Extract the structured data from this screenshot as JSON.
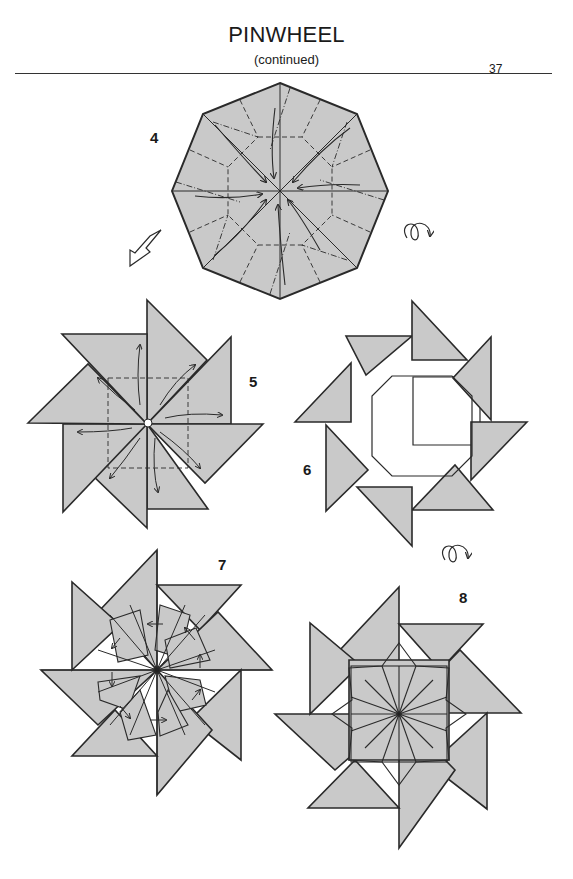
{
  "header": {
    "title": "PINWHEEL",
    "subtitle": "(continued)",
    "page_number": "37"
  },
  "colors": {
    "paper_fill": "#c9c9c9",
    "line": "#2a2a2a",
    "background": "#ffffff"
  },
  "steps": [
    {
      "number": "4",
      "shape": "octagon with crease pattern and fold arrows",
      "symbols": [
        "push-in-arrow-icon",
        "turn-over-icon"
      ]
    },
    {
      "number": "5",
      "shape": "eight-point pinwheel with unfold arrows"
    },
    {
      "number": "6",
      "shape": "eight-point ring with octagonal hole",
      "symbols": [
        "turn-over-icon"
      ]
    },
    {
      "number": "7",
      "shape": "eight-point pinwheel with radial folds and arrows"
    },
    {
      "number": "8",
      "shape": "finished eight-point pinwheel"
    }
  ]
}
